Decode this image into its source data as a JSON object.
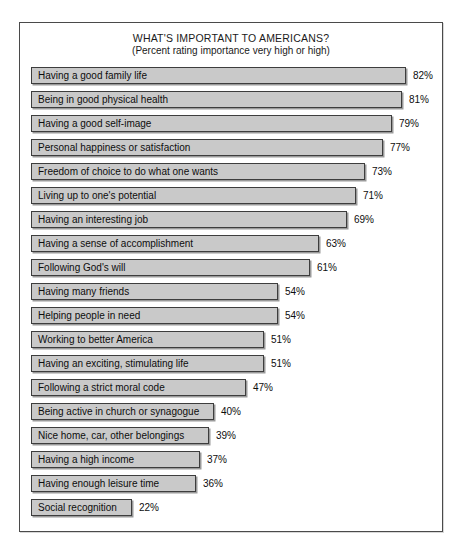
{
  "chart_data": {
    "type": "bar",
    "orientation": "horizontal",
    "title": "WHAT'S IMPORTANT TO AMERICANS?",
    "subtitle": "(Percent rating importance very high or high)",
    "xlabel": "",
    "ylabel": "",
    "xlim": [
      0,
      100
    ],
    "grid": false,
    "legend": null,
    "value_suffix": "%",
    "categories": [
      "Having a good family life",
      "Being in good physical health",
      "Having a good self-image",
      "Personal happiness or satisfaction",
      "Freedom of choice to do what one wants",
      "Living up to one's potential",
      "Having an interesting job",
      "Having a sense of accomplishment",
      "Following God's will",
      "Having many friends",
      "Helping people in need",
      "Working to better America",
      "Having an exciting, stimulating life",
      "Following a strict moral code",
      "Being active in church or synagogue",
      "Nice home, car, other belongings",
      "Having a high income",
      "Having enough leisure time",
      "Social recognition"
    ],
    "values": [
      82,
      81,
      79,
      77,
      73,
      71,
      69,
      63,
      61,
      54,
      54,
      51,
      51,
      47,
      40,
      39,
      37,
      36,
      22
    ],
    "value_labels": [
      "82%",
      "81%",
      "79%",
      "77%",
      "73%",
      "71%",
      "69%",
      "63%",
      "61%",
      "54%",
      "54%",
      "51%",
      "51%",
      "47%",
      "40%",
      "39%",
      "37%",
      "36%",
      "22%"
    ],
    "colors": {
      "bar_fill": "#c9c9c9",
      "bar_border": "#3d3d3d",
      "bar_shadow": "#9a9a9a",
      "frame_border": "#4a4a4a",
      "background": "#ffffff",
      "text": "#0d0d0d"
    }
  }
}
